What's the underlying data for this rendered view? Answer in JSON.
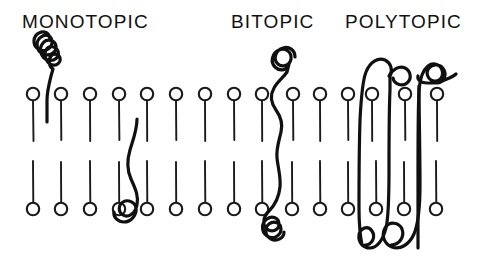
{
  "figure": {
    "background_color": "#ffffff",
    "ink_color": "#101010",
    "width": 484,
    "height": 272
  },
  "labels": [
    {
      "text": "MONOTOPIC",
      "x": 22,
      "y": 28
    },
    {
      "text": "BITOPIC",
      "x": 231,
      "y": 28
    },
    {
      "text": "POLYTOPIC",
      "x": 345,
      "y": 28
    }
  ],
  "membrane": {
    "description": "lipid bilayer drawn as two leaflets of circle-headed lipids",
    "head_radius": 6.2,
    "upper_leaflet": {
      "head_center_y": 94,
      "tail_end_y": 141,
      "head_x": [
        33,
        61,
        90,
        119,
        147,
        176,
        205,
        234,
        262,
        293,
        320,
        348,
        372,
        405,
        437
      ]
    },
    "lower_leaflet": {
      "head_center_y": 209,
      "tail_start_y": 161,
      "head_x": [
        33,
        61,
        90,
        119,
        147,
        176,
        205,
        234,
        262,
        292,
        320,
        348,
        376,
        404,
        436
      ]
    }
  },
  "proteins": [
    {
      "name": "monotopic-upper",
      "class": "MONOTOPIC",
      "description": "coiled globular domain above bilayer with a short anchor entering the outer leaflet",
      "anchor_side": "upper"
    },
    {
      "name": "monotopic-lower",
      "class": "MONOTOPIC",
      "description": "wavy anchor in the inner leaflet with a small coil below the bilayer",
      "anchor_side": "lower"
    },
    {
      "name": "bitopic",
      "class": "BITOPIC",
      "description": "single chain crossing the bilayer once, coiled domain above and cloverleaf coil below",
      "transmembrane_spans": 1
    },
    {
      "name": "polytopic",
      "class": "POLYTOPIC",
      "description": "single chain crossing the bilayer several times with hairpin turns above and below",
      "transmembrane_spans": 4
    }
  ]
}
